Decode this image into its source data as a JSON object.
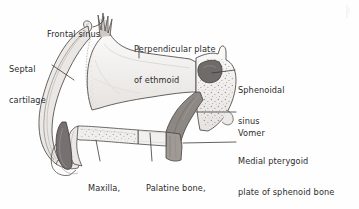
{
  "figure": {
    "background_color": "#fefefe",
    "ink_color": "#3a3a3a",
    "label_color": "#2c2c2c",
    "shade_colors": {
      "bone_light": "#f0eeec",
      "bone_mid": "#d8d4d0",
      "cartilage": "#e8e5e2",
      "sphenoid_sinus_dark": "#6f6b68",
      "vomer_dark": "#8d8884",
      "pterygoid_dark": "#a09a95",
      "incisor_dark": "#767170"
    }
  },
  "labels": [
    {
      "id": "frontal-sinus",
      "text": "Frontal sinus",
      "lines": [
        "Frontal sinus"
      ],
      "x": 47,
      "y": 9,
      "align": "left",
      "style": "normal"
    },
    {
      "id": "septal-cartilage",
      "text": "Septal cartilage",
      "lines": [
        "Septal",
        "cartilage"
      ],
      "x": 9,
      "y": 44,
      "align": "left",
      "style": "normal"
    },
    {
      "id": "perpendicular-plate-of-ethmoid",
      "text": "Perpendicular plate of ethmoid",
      "lines": [
        "Perpendicular plate",
        "of ethmoid"
      ],
      "x": 134,
      "y": 24,
      "align": "left",
      "style": "second-line-blurred"
    },
    {
      "id": "sphenoidal-sinus",
      "text": "Sphenoidal sinus",
      "lines": [
        "Sphenoidal",
        "sinus"
      ],
      "x": 238,
      "y": 65,
      "align": "left",
      "style": "normal"
    },
    {
      "id": "vomer",
      "text": "Vomer",
      "lines": [
        "Vomer"
      ],
      "x": 238,
      "y": 108,
      "align": "left",
      "style": "normal"
    },
    {
      "id": "medial-pterygoid-plate",
      "text": "Medial pterygoid plate of sphenoid bone",
      "lines": [
        "Medial pterygoid",
        "plate of sphenoid bone"
      ],
      "x": 238,
      "y": 136,
      "align": "left",
      "style": "normal"
    },
    {
      "id": "maxilla-palatine-process",
      "text": "Maxilla, palatine process",
      "lines": [
        "Maxilla,",
        "palatine",
        "process"
      ],
      "x": 88,
      "y": 163,
      "align": "left",
      "style": "normal"
    },
    {
      "id": "palatine-bone-horizontal-process",
      "text": "Palatine bone, horizontal process",
      "lines": [
        "Palatine bone,",
        "horizontal",
        "process"
      ],
      "x": 146,
      "y": 163,
      "align": "left",
      "style": "normal"
    }
  ],
  "structures": [
    {
      "id": "frontal-sinus-region",
      "name": "frontal sinus"
    },
    {
      "id": "septal-cartilage-region",
      "name": "septal cartilage"
    },
    {
      "id": "perpendicular-plate-region",
      "name": "perpendicular plate of ethmoid"
    },
    {
      "id": "sphenoidal-sinus-region",
      "name": "sphenoidal sinus"
    },
    {
      "id": "vomer-region",
      "name": "vomer"
    },
    {
      "id": "medial-pterygoid-plate-region",
      "name": "medial pterygoid plate of sphenoid bone"
    },
    {
      "id": "maxilla-palatine-process-region",
      "name": "maxilla, palatine process"
    },
    {
      "id": "palatine-bone-region",
      "name": "palatine bone, horizontal process"
    },
    {
      "id": "incisor-region",
      "name": "incisor tooth"
    }
  ]
}
